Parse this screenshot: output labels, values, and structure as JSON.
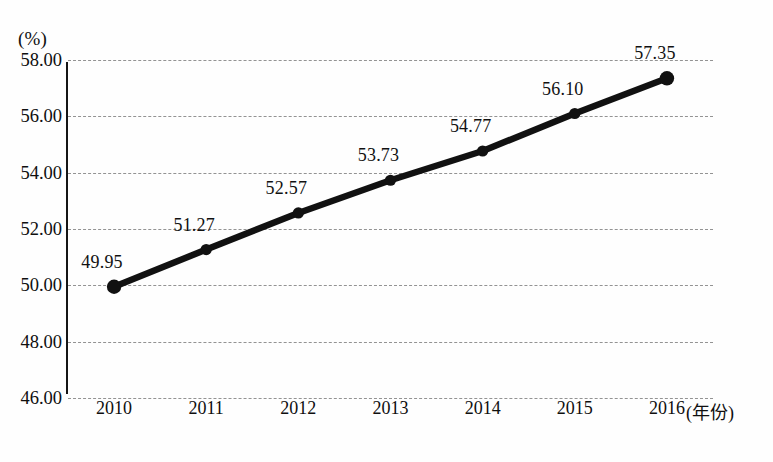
{
  "chart_data": {
    "type": "line",
    "title": "",
    "subtitle": "",
    "xlabel": "(年份)",
    "ylabel": "(%)",
    "categories": [
      "2010",
      "2011",
      "2012",
      "2013",
      "2014",
      "2015",
      "2016"
    ],
    "values": [
      49.95,
      51.27,
      52.57,
      53.73,
      54.77,
      56.1,
      57.35
    ],
    "point_labels": [
      "49.95",
      "51.27",
      "52.57",
      "53.73",
      "54.77",
      "56.10",
      "57.35"
    ],
    "series": [
      {
        "name": "",
        "values": [
          49.95,
          51.27,
          52.57,
          53.73,
          54.77,
          56.1,
          57.35
        ]
      }
    ],
    "ylim": [
      46.0,
      58.0
    ],
    "y_ticks": [
      58.0,
      56.0,
      54.0,
      52.0,
      50.0,
      48.0,
      46.0
    ],
    "y_tick_labels": [
      "58.00",
      "56.00",
      "54.00",
      "52.00",
      "50.00",
      "48.00",
      "46.00"
    ],
    "x_ticks": [
      "2010",
      "2011",
      "2012",
      "2013",
      "2014",
      "2015",
      "2016"
    ],
    "grid": "horizontal-dashed",
    "legend": "none",
    "line_color": "#111111",
    "marker_color": "#111111",
    "marker_shape": "circle",
    "grid_color": "#8e8e8e",
    "axis_color": "#151515"
  },
  "caption": {
    "text": ""
  }
}
